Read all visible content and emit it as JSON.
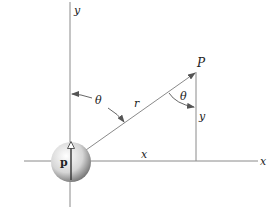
{
  "diagram": {
    "axes": {
      "x_label": "x",
      "y_label": "y"
    },
    "point": {
      "label": "P"
    },
    "segments": {
      "radius_label": "r",
      "horizontal_label": "x",
      "vertical_label": "y"
    },
    "angles": {
      "left_label": "θ",
      "right_label": "θ"
    },
    "dipole": {
      "label": "p"
    },
    "colors": {
      "line": "#8a8a8a",
      "text": "#222222",
      "sphere_light": "#ffffff",
      "sphere_dark": "#6e6e6e"
    }
  }
}
